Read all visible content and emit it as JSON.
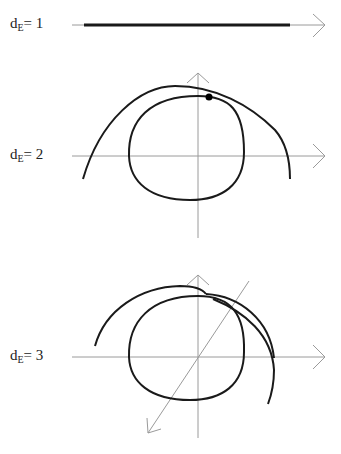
{
  "panels": [
    {
      "label_base": "d",
      "label_sub": "E",
      "label_rest": "= 1"
    },
    {
      "label_base": "d",
      "label_sub": "E",
      "label_rest": "= 2"
    },
    {
      "label_base": "d",
      "label_sub": "E",
      "label_rest": "= 3"
    }
  ],
  "colors": {
    "axis": "#9a9a9a",
    "curve": "#1a1a1a",
    "point": "#000000"
  }
}
